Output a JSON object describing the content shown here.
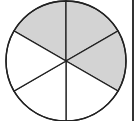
{
  "diagram": {
    "type": "fraction-circle",
    "total_parts": 6,
    "shaded_parts": 3,
    "shaded_sectors": [
      0,
      1,
      2
    ],
    "fraction_label": "3/6",
    "colors": {
      "shaded": "#d3d3d3",
      "unshaded": "#ffffff",
      "stroke": "#222222",
      "background": "#ffffff"
    }
  }
}
